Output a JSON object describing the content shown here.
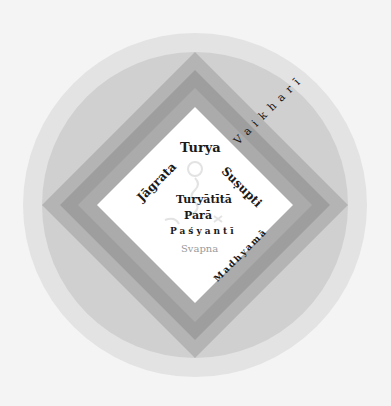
{
  "diagram": {
    "title": "",
    "colors": {
      "background": "#f4f4f4",
      "outer_circle": "#e3e3e3",
      "inner_circle": "#d0d0d0",
      "diamond_band_outer": "#b4b4b4",
      "diamond_band_middle": "#9e9e9e",
      "diamond_band_inner": "#ababab",
      "center": "#ffffff",
      "text": "#1a1a1a",
      "text_faded": "#9a9a9a"
    },
    "labels": {
      "turya": "Turya",
      "jagrata": "Jāgrata",
      "susupti": "Suṣupti",
      "turyatita": "Turyātītā",
      "para": "Parā",
      "pasyanti": "Paśyantī",
      "svapna": "Svapna",
      "madhyama": "Madhyamā",
      "vaikhari": "Vaikharī"
    },
    "center_symbol": "faint-om-icon"
  }
}
